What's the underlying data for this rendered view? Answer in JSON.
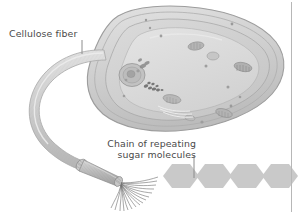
{
  "figure": {
    "kind": "scientific-illustration",
    "background_color": "#ffffff"
  },
  "labels": {
    "cellulose_fiber": "Cellulose fiber",
    "sugar_chain_line1": "Chain of repeating",
    "sugar_chain_line2": "sugar molecules",
    "text_color": "#4a4a4a"
  },
  "leader_lines": {
    "cellulose_fiber_tick": "vertical-tick",
    "sugar_chain_tick": "vertical-tick",
    "color": "#8c8c8c"
  },
  "cell": {
    "name": "plant-cell",
    "shape": "rounded-capsule-tilted",
    "wall_color": "#d2d2d2",
    "wall_outline": "#9a9a9a",
    "cytoplasm_color": "#cfcfcf",
    "vacuole_color": "#d9d9d9",
    "organelles": [
      "nucleus",
      "chloroplast",
      "chloroplast",
      "chloroplast",
      "mitochondrion",
      "mitochondrion",
      "golgi",
      "endoplasmic-reticulum"
    ]
  },
  "fiber": {
    "name": "cellulose-fiber-ribbon",
    "color": "#cccccc",
    "outline": "#a6a6a6",
    "strand_count": 16,
    "strand_color": "#6e6e6e"
  },
  "hexagons": {
    "name": "sugar-molecule-chain",
    "count": 4,
    "fill": "#c9c9c9",
    "labels": [
      "glucose",
      "glucose",
      "glucose",
      "glucose"
    ]
  },
  "divider": {
    "name": "right-margin-rule",
    "color": "#b7b7b7"
  }
}
